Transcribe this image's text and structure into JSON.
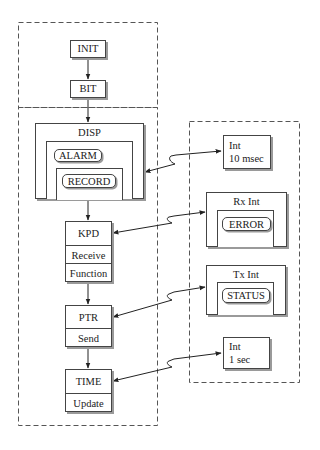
{
  "diagram": {
    "type": "task-interrupt architecture",
    "groups": {
      "init_group": {
        "label": ""
      },
      "main_loop_group": {
        "label": ""
      },
      "interrupt_group": {
        "label": ""
      }
    },
    "init": {
      "label": "INIT"
    },
    "bit": {
      "label": "BIT"
    },
    "disp": {
      "label": "DISP",
      "alarm": "ALARM",
      "record": "RECORD"
    },
    "kpd": {
      "label": "KPD",
      "sections": [
        "Receive",
        "Function"
      ]
    },
    "ptr": {
      "label": "PTR",
      "sections": [
        "Send"
      ]
    },
    "time": {
      "label": "TIME",
      "sections": [
        "Update"
      ]
    },
    "int_10ms": {
      "line1": "Int",
      "line2": "10 msec"
    },
    "rx_int": {
      "label": "Rx Int",
      "inner": "ERROR"
    },
    "tx_int": {
      "label": "Tx Int",
      "inner": "STATUS"
    },
    "int_1s": {
      "line1": "Int",
      "line2": "1 sec"
    },
    "edges": [
      {
        "from": "INIT",
        "to": "BIT",
        "style": "arrow"
      },
      {
        "from": "BIT",
        "to": "DISP",
        "style": "arrow"
      },
      {
        "from": "DISP",
        "to": "KPD",
        "style": "arrow"
      },
      {
        "from": "KPD",
        "to": "PTR",
        "style": "arrow"
      },
      {
        "from": "PTR",
        "to": "TIME",
        "style": "arrow"
      },
      {
        "from": "DISP",
        "to": "Int 10 msec",
        "style": "bidirectional-break"
      },
      {
        "from": "KPD",
        "to": "Rx Int",
        "style": "bidirectional-break"
      },
      {
        "from": "PTR",
        "to": "Tx Int",
        "style": "bidirectional-break"
      },
      {
        "from": "TIME",
        "to": "Int 1 sec",
        "style": "bidirectional-break"
      }
    ]
  }
}
